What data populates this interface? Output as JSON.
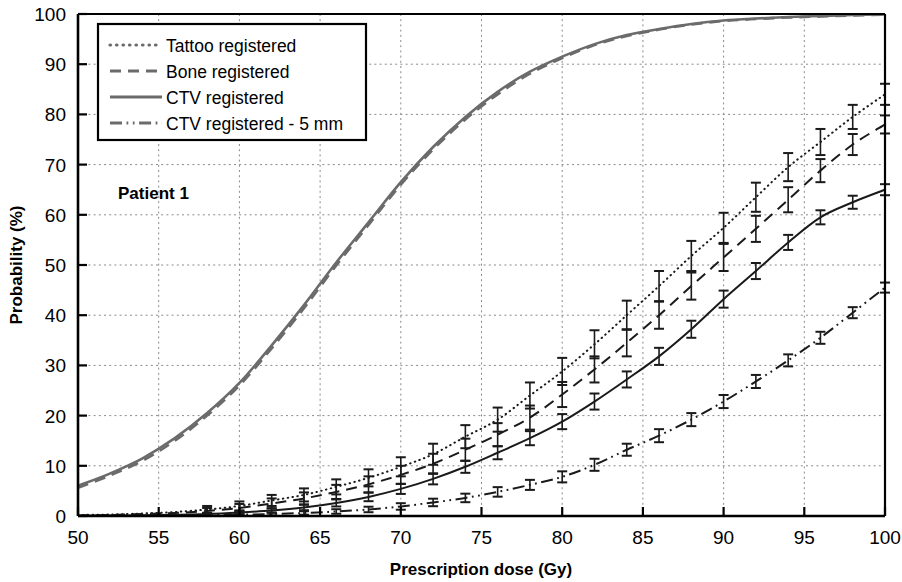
{
  "chart_data": {
    "type": "line",
    "title": "",
    "annotation": "Patient 1",
    "xlabel": "Prescription dose (Gy)",
    "ylabel": "Probability (%)",
    "xlim": [
      50,
      100
    ],
    "ylim": [
      0,
      100
    ],
    "xticks": [
      50,
      55,
      60,
      65,
      70,
      75,
      80,
      85,
      90,
      95,
      100
    ],
    "yticks": [
      0,
      10,
      20,
      30,
      40,
      50,
      60,
      70,
      80,
      90,
      100
    ],
    "grid": true,
    "grid_style": "dotted",
    "legend_position": "upper-left",
    "colors": {
      "upper_group": "#6b6b6b",
      "lower_group": "#1a1a1a",
      "grid": "#8a8a8a",
      "axis": "#000000"
    },
    "series": [
      {
        "name": "Tattoo registered",
        "style": "dotted",
        "group": "lower",
        "x": [
          50,
          52,
          54,
          56,
          58,
          60,
          62,
          64,
          66,
          68,
          70,
          72,
          74,
          76,
          78,
          80,
          82,
          84,
          86,
          88,
          90,
          92,
          94,
          96,
          98,
          100
        ],
        "values": [
          0.2,
          0.3,
          0.5,
          0.8,
          1.3,
          2.0,
          3.1,
          4.2,
          5.8,
          7.6,
          9.8,
          12.3,
          15.8,
          19.2,
          24.0,
          28.8,
          34.2,
          40.0,
          45.8,
          51.8,
          57.4,
          63.5,
          69.5,
          74.5,
          79.5,
          84.0
        ],
        "errors": [
          0.2,
          0.3,
          0.4,
          0.5,
          0.7,
          0.9,
          1.1,
          1.3,
          1.5,
          1.7,
          1.9,
          2.1,
          2.3,
          2.4,
          2.6,
          2.7,
          2.8,
          2.9,
          3.0,
          3.0,
          3.0,
          2.9,
          2.8,
          2.6,
          2.4,
          2.1
        ]
      },
      {
        "name": "Bone registered",
        "style": "dashed",
        "group": "lower",
        "x": [
          50,
          52,
          54,
          56,
          58,
          60,
          62,
          64,
          66,
          68,
          70,
          72,
          74,
          76,
          78,
          80,
          82,
          84,
          86,
          88,
          90,
          92,
          94,
          96,
          98,
          100
        ],
        "values": [
          0.1,
          0.2,
          0.4,
          0.6,
          1.0,
          1.6,
          2.5,
          3.5,
          4.8,
          6.3,
          8.2,
          10.4,
          13.2,
          16.2,
          19.6,
          24.2,
          29.2,
          34.5,
          40.0,
          45.8,
          51.5,
          57.2,
          63.0,
          68.8,
          74.0,
          78.0
        ],
        "errors": [
          0.2,
          0.25,
          0.35,
          0.45,
          0.6,
          0.8,
          1.0,
          1.2,
          1.4,
          1.6,
          1.8,
          2.0,
          2.2,
          2.3,
          2.4,
          2.5,
          2.6,
          2.7,
          2.7,
          2.7,
          2.7,
          2.6,
          2.5,
          2.3,
          2.1,
          1.8
        ]
      },
      {
        "name": "CTV registered",
        "style": "solid",
        "group": "lower",
        "x": [
          50,
          52,
          54,
          56,
          58,
          60,
          62,
          64,
          66,
          68,
          70,
          72,
          74,
          76,
          78,
          80,
          82,
          84,
          86,
          88,
          90,
          92,
          94,
          96,
          98,
          100
        ],
        "values": [
          0.05,
          0.1,
          0.15,
          0.25,
          0.4,
          0.7,
          1.1,
          1.7,
          2.6,
          3.8,
          5.4,
          7.4,
          9.8,
          12.6,
          15.5,
          18.8,
          22.8,
          27.2,
          31.8,
          37.2,
          43.2,
          48.8,
          54.5,
          59.5,
          62.5,
          65.0
        ],
        "errors": [
          0.1,
          0.1,
          0.15,
          0.2,
          0.25,
          0.35,
          0.45,
          0.55,
          0.7,
          0.85,
          1.0,
          1.1,
          1.2,
          1.3,
          1.4,
          1.5,
          1.6,
          1.6,
          1.7,
          1.7,
          1.7,
          1.6,
          1.5,
          1.4,
          1.3,
          1.1
        ]
      },
      {
        "name": "CTV registered - 5 mm",
        "style": "dashdot",
        "group": "lower",
        "x": [
          50,
          52,
          54,
          56,
          58,
          60,
          62,
          64,
          66,
          68,
          70,
          72,
          74,
          76,
          78,
          80,
          82,
          84,
          86,
          88,
          90,
          92,
          94,
          96,
          98,
          100
        ],
        "values": [
          0.02,
          0.04,
          0.06,
          0.1,
          0.15,
          0.25,
          0.4,
          0.6,
          0.9,
          1.3,
          1.9,
          2.7,
          3.6,
          4.8,
          6.2,
          7.8,
          10.2,
          13.2,
          16.0,
          19.2,
          22.8,
          26.8,
          31.0,
          35.5,
          40.5,
          45.5
        ],
        "errors": [
          0.05,
          0.05,
          0.08,
          0.1,
          0.15,
          0.2,
          0.28,
          0.35,
          0.45,
          0.55,
          0.65,
          0.75,
          0.85,
          0.95,
          1.0,
          1.1,
          1.2,
          1.2,
          1.3,
          1.3,
          1.3,
          1.3,
          1.2,
          1.2,
          1.1,
          1.0
        ]
      },
      {
        "name": "CTV registered (upper)",
        "style": "solid",
        "group": "upper",
        "x": [
          50,
          52,
          54,
          56,
          58,
          60,
          62,
          64,
          66,
          68,
          70,
          72,
          74,
          76,
          78,
          80,
          82,
          84,
          86,
          88,
          90,
          92,
          94,
          96,
          98,
          100
        ],
        "values": [
          6.0,
          8.5,
          11.5,
          15.5,
          20.5,
          26.5,
          34.0,
          42.0,
          50.5,
          58.5,
          66.5,
          73.5,
          79.5,
          84.5,
          88.5,
          91.5,
          94.0,
          95.8,
          97.0,
          98.0,
          98.7,
          99.1,
          99.4,
          99.6,
          99.8,
          99.9
        ],
        "errors": null
      },
      {
        "name": "Bone registered (upper)",
        "style": "dashed",
        "group": "upper",
        "x": [
          50,
          52,
          54,
          56,
          58,
          60,
          62,
          64,
          66,
          68,
          70,
          72,
          74,
          76,
          78,
          80,
          82,
          84,
          86,
          88,
          90,
          92,
          94,
          96,
          98,
          100
        ],
        "values": [
          5.6,
          8.1,
          11.0,
          15.0,
          20.0,
          26.0,
          33.4,
          41.4,
          49.9,
          58.0,
          66.0,
          73.0,
          79.0,
          84.0,
          88.1,
          91.2,
          93.8,
          95.6,
          96.9,
          97.9,
          98.6,
          99.0,
          99.3,
          99.5,
          99.7,
          99.85
        ],
        "errors": null
      }
    ],
    "legend_entries": [
      {
        "label": "Tattoo registered",
        "style": "dotted"
      },
      {
        "label": "Bone registered",
        "style": "dashed"
      },
      {
        "label": "CTV registered",
        "style": "solid"
      },
      {
        "label": "CTV registered - 5 mm",
        "style": "dashdot"
      }
    ]
  }
}
